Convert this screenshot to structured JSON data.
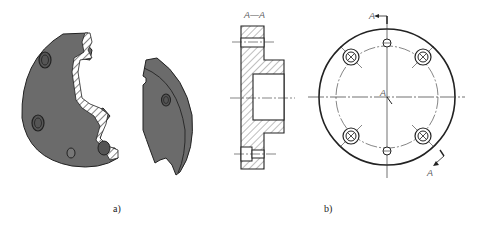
{
  "figure": {
    "caption_a": "a)",
    "caption_b": "b)",
    "section_title": "A—A",
    "cut_label_top": "A",
    "cut_label_bottom": "A",
    "center_label": "A",
    "colors": {
      "solid_fill": "#6b6b6b",
      "line": "#222222",
      "hatch": "#444444",
      "centerline": "#333333"
    }
  }
}
